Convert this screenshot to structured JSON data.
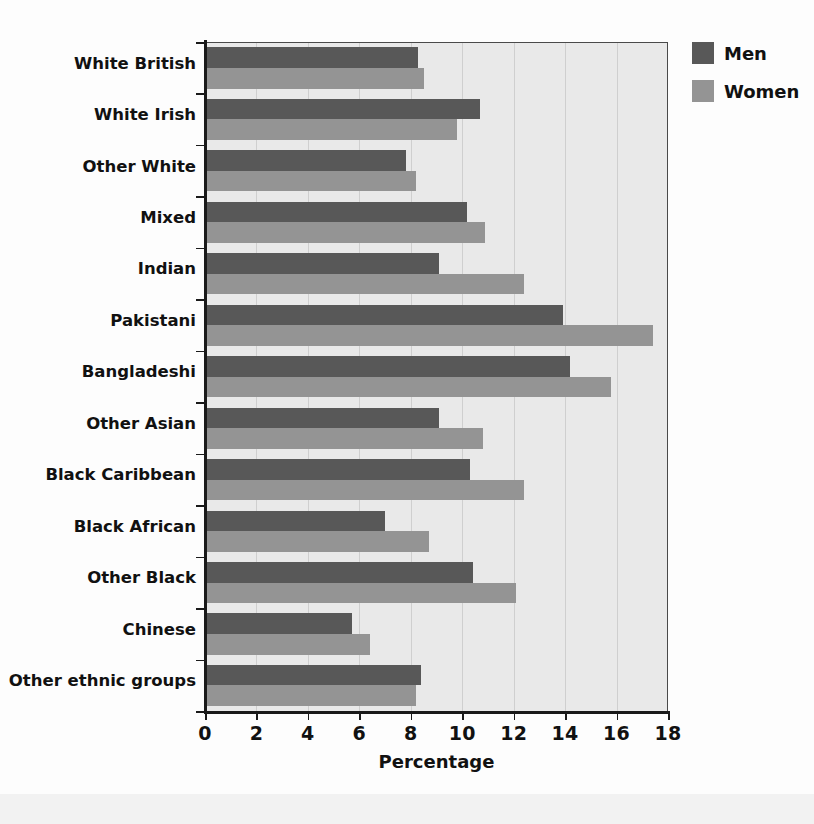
{
  "chart_data": {
    "type": "bar",
    "orientation": "horizontal",
    "title": "",
    "xlabel": "Percentage",
    "ylabel": "",
    "xlim": [
      0,
      18
    ],
    "xticks": [
      0,
      2,
      4,
      6,
      8,
      10,
      12,
      14,
      16,
      18
    ],
    "grid": "vertical",
    "legend_position": "top-right",
    "categories": [
      "White British",
      "White Irish",
      "Other White",
      "Mixed",
      "Indian",
      "Pakistani",
      "Bangladeshi",
      "Other Asian",
      "Black Caribbean",
      "Black African",
      "Other Black",
      "Chinese",
      "Other ethnic groups"
    ],
    "series": [
      {
        "name": "Men",
        "color": "#585858",
        "values": [
          8.3,
          10.7,
          7.8,
          10.2,
          9.1,
          13.9,
          14.2,
          9.1,
          10.3,
          7.0,
          10.4,
          5.7,
          8.4
        ]
      },
      {
        "name": "Women",
        "color": "#949494",
        "values": [
          8.5,
          9.8,
          8.2,
          10.9,
          12.4,
          17.4,
          15.8,
          10.8,
          12.4,
          8.7,
          12.1,
          6.4,
          8.2
        ]
      }
    ]
  },
  "legend": {
    "items": [
      {
        "label": "Men",
        "color": "#585858"
      },
      {
        "label": "Women",
        "color": "#949494"
      }
    ]
  },
  "axis": {
    "x_title": "Percentage"
  }
}
